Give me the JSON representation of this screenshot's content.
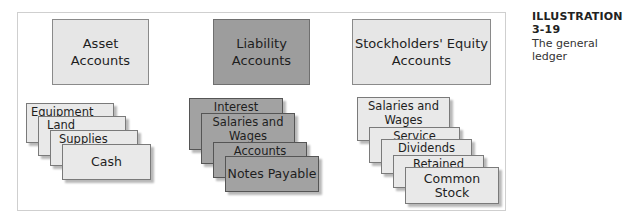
{
  "caption": {
    "title": "ILLUSTRATION 3-19",
    "subtitle": "The general ledger"
  },
  "colors": {
    "light_fill": "#e6e6e6",
    "dark_fill": "#9d9d9d",
    "frame_border": "#cfcfcf"
  },
  "groups": [
    {
      "header": "Asset\nAccounts",
      "style": "light",
      "accounts": [
        "Equipment",
        "Land",
        "Supplies",
        "Cash"
      ]
    },
    {
      "header": "Liability\nAccounts",
      "style": "dark",
      "accounts": [
        "Interest Payable",
        "Salaries and Wages\nPayable",
        "Accounts Payable",
        "Notes Payable"
      ]
    },
    {
      "header": "Stockholders' Equity\nAccounts",
      "style": "light",
      "accounts": [
        "Salaries and Wages\nExpense",
        "Service Revenue",
        "Dividends",
        "Retained Earnings",
        "Common Stock"
      ]
    }
  ]
}
